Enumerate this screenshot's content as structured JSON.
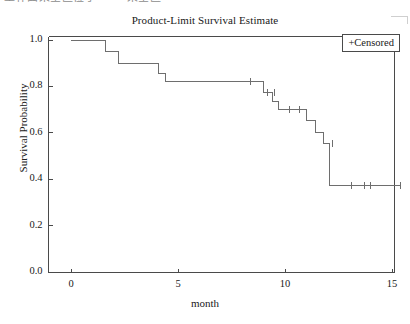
{
  "scan": {
    "top_text": "工作面采空区位于 —— 采空区",
    "corner_mark_name": "scan-corner-artifact"
  },
  "chart_data": {
    "type": "line",
    "subtype": "kaplan-meier-step",
    "title": "Product-Limit Survival Estimate",
    "xlabel": "month",
    "ylabel": "Survival Probability",
    "xlim": [
      0,
      15.6
    ],
    "ylim": [
      0.0,
      1.0
    ],
    "xticks": [
      0,
      5,
      10,
      15
    ],
    "xtick_labels": [
      "0",
      "5",
      "10",
      "15"
    ],
    "yticks": [
      0.0,
      0.2,
      0.4,
      0.6,
      0.8,
      1.0
    ],
    "ytick_labels": [
      "0.0",
      "0.2",
      "0.4",
      "0.6",
      "0.8",
      "1.0"
    ],
    "grid": false,
    "legend_position": "top-right",
    "legend": [
      {
        "marker": "+",
        "label": "Censored",
        "text": "+Censored"
      }
    ],
    "series": [
      {
        "name": "Survival",
        "color": "#6e6e6e",
        "step": "post",
        "x": [
          0.0,
          1.6,
          1.6,
          2.2,
          2.2,
          4.1,
          4.1,
          4.4,
          4.4,
          9.0,
          9.0,
          9.4,
          9.4,
          9.7,
          9.7,
          11.0,
          11.0,
          11.4,
          11.4,
          11.8,
          11.8,
          12.1,
          12.1,
          15.4
        ],
        "y": [
          1.0,
          1.0,
          0.95,
          0.95,
          0.9,
          0.9,
          0.855,
          0.855,
          0.82,
          0.82,
          0.775,
          0.775,
          0.735,
          0.735,
          0.7,
          0.7,
          0.655,
          0.655,
          0.6,
          0.6,
          0.555,
          0.555,
          0.375,
          0.375
        ]
      }
    ],
    "censored_points": [
      {
        "x": 8.4,
        "y": 0.82
      },
      {
        "x": 9.2,
        "y": 0.775
      },
      {
        "x": 9.5,
        "y": 0.775
      },
      {
        "x": 10.2,
        "y": 0.7
      },
      {
        "x": 10.7,
        "y": 0.7
      },
      {
        "x": 12.2,
        "y": 0.555
      },
      {
        "x": 13.1,
        "y": 0.375
      },
      {
        "x": 13.7,
        "y": 0.375
      },
      {
        "x": 14.0,
        "y": 0.375
      },
      {
        "x": 15.4,
        "y": 0.375
      }
    ]
  },
  "style": {
    "axis_color": "#4a4a4a",
    "curve_color": "#6e6e6e",
    "text_color": "#202020",
    "background": "#ffffff"
  }
}
